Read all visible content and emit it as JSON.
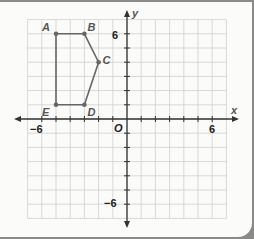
{
  "figure": {
    "x_axis_label": "x",
    "y_axis_label": "y",
    "origin_label": "O",
    "ticks": {
      "x_neg": "−6",
      "x_pos": "6",
      "y_pos": "6",
      "y_neg": "−6"
    },
    "range": {
      "x": [
        -7,
        7
      ],
      "y": [
        -7,
        7
      ]
    },
    "polygon": {
      "vertices": [
        {
          "label": "A",
          "x": -5,
          "y": 6
        },
        {
          "label": "B",
          "x": -3,
          "y": 6
        },
        {
          "label": "C",
          "x": -2,
          "y": 4
        },
        {
          "label": "D",
          "x": -3,
          "y": 1
        },
        {
          "label": "E",
          "x": -5,
          "y": 1
        }
      ],
      "color": "#666666"
    }
  }
}
